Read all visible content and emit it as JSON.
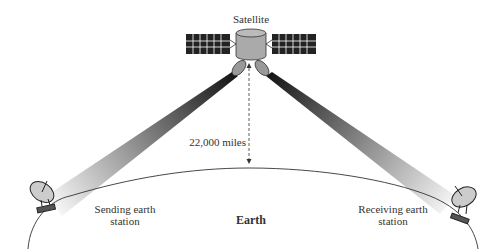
{
  "labels": {
    "satellite": "Satellite",
    "distance": "22,000 miles",
    "sending_1": "Sending earth",
    "sending_2": "station",
    "receiving_1": "Receiving earth",
    "receiving_2": "station",
    "earth": "Earth"
  }
}
